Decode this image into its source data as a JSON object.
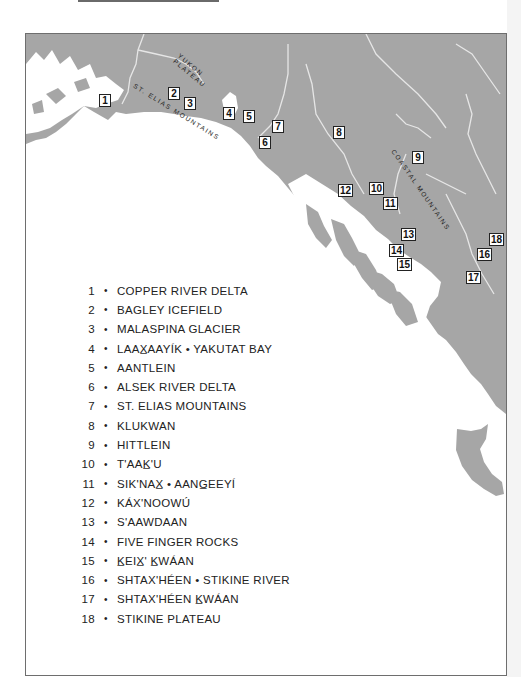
{
  "page": {
    "colors": {
      "land": "#a6a6a6",
      "water": "#ffffff",
      "frame": "#6e6e6e",
      "rivers": "#e6e6e6"
    }
  },
  "map": {
    "region_labels": [
      {
        "id": "yukon",
        "line1": "YUKON",
        "line2": "PLATEAU"
      },
      {
        "id": "st-elias",
        "text": "ST. ELIAS MOUNTAINS"
      },
      {
        "id": "coastal",
        "text": "COASTAL MOUNTAINS"
      }
    ],
    "markers": [
      {
        "n": "1",
        "x": 73,
        "y": 60
      },
      {
        "n": "2",
        "x": 142,
        "y": 53
      },
      {
        "n": "3",
        "x": 158,
        "y": 63
      },
      {
        "n": "4",
        "x": 197,
        "y": 73
      },
      {
        "n": "5",
        "x": 217,
        "y": 76
      },
      {
        "n": "6",
        "x": 233,
        "y": 102
      },
      {
        "n": "7",
        "x": 246,
        "y": 86
      },
      {
        "n": "8",
        "x": 307,
        "y": 92
      },
      {
        "n": "9",
        "x": 386,
        "y": 117
      },
      {
        "n": "10",
        "x": 343,
        "y": 148
      },
      {
        "n": "11",
        "x": 357,
        "y": 163
      },
      {
        "n": "12",
        "x": 312,
        "y": 150
      },
      {
        "n": "13",
        "x": 375,
        "y": 194
      },
      {
        "n": "14",
        "x": 363,
        "y": 210
      },
      {
        "n": "15",
        "x": 371,
        "y": 224
      },
      {
        "n": "16",
        "x": 451,
        "y": 214
      },
      {
        "n": "17",
        "x": 440,
        "y": 237
      },
      {
        "n": "18",
        "x": 463,
        "y": 199
      }
    ]
  },
  "legend": {
    "items": [
      {
        "num": "1",
        "bullet": "•",
        "name": "COPPER RIVER DELTA"
      },
      {
        "num": "2",
        "bullet": "•",
        "name": "BAGLEY ICEFIELD"
      },
      {
        "num": "3",
        "bullet": "•",
        "name": "MALASPINA GLACIER"
      },
      {
        "num": "4",
        "bullet": "•",
        "name": "LAAX̲AAYÍK • YAKUTAT BAY"
      },
      {
        "num": "5",
        "bullet": "•",
        "name": "AANTLEIN"
      },
      {
        "num": "6",
        "bullet": "•",
        "name": "ALSEK RIVER DELTA"
      },
      {
        "num": "7",
        "bullet": "•",
        "name": "ST. ELIAS MOUNTAINS"
      },
      {
        "num": "8",
        "bullet": "•",
        "name": "KLUKWAN"
      },
      {
        "num": "9",
        "bullet": "•",
        "name": "HITTLEIN"
      },
      {
        "num": "10",
        "bullet": "•",
        "name": "T'AAK̲'U"
      },
      {
        "num": "11",
        "bullet": "•",
        "name": "SIK'NAX̲ • AANG̲EEYÍ"
      },
      {
        "num": "12",
        "bullet": "•",
        "name": "KÁX'NOOWÚ"
      },
      {
        "num": "13",
        "bullet": "•",
        "name": "S'AAWDAAN"
      },
      {
        "num": "14",
        "bullet": "•",
        "name": "FIVE FINGER ROCKS"
      },
      {
        "num": "15",
        "bullet": "•",
        "name": "K̲EIX̲' K̲WÁAN"
      },
      {
        "num": "16",
        "bullet": "•",
        "name": "SHTAX'HÉEN • STIKINE RIVER"
      },
      {
        "num": "17",
        "bullet": "•",
        "name": "SHTAX'HÉEN K̲WÁAN"
      },
      {
        "num": "18",
        "bullet": "•",
        "name": "STIKINE PLATEAU"
      }
    ]
  }
}
